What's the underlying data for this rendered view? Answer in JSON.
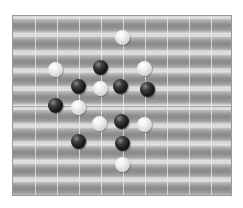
{
  "board": {
    "columns": 10,
    "rows": 10,
    "colors": {
      "background": "#ffffff",
      "tile_dark": "#8b8b8b",
      "tile_light": "#e6e6e6",
      "grid_line": "#ebebeb",
      "black_stone": "#141414",
      "white_stone": "#f0f0f0"
    }
  },
  "stones": [
    {
      "color": "white",
      "x": 122,
      "y": 37
    },
    {
      "color": "white",
      "x": 55,
      "y": 69
    },
    {
      "color": "black",
      "x": 100,
      "y": 67
    },
    {
      "color": "white",
      "x": 144,
      "y": 68
    },
    {
      "color": "black",
      "x": 78,
      "y": 86
    },
    {
      "color": "white",
      "x": 100,
      "y": 88
    },
    {
      "color": "black",
      "x": 120,
      "y": 86
    },
    {
      "color": "black",
      "x": 147,
      "y": 89
    },
    {
      "color": "black",
      "x": 55,
      "y": 105
    },
    {
      "color": "white",
      "x": 78,
      "y": 107
    },
    {
      "color": "white",
      "x": 99,
      "y": 123
    },
    {
      "color": "black",
      "x": 121,
      "y": 121
    },
    {
      "color": "white",
      "x": 144,
      "y": 124
    },
    {
      "color": "black",
      "x": 78,
      "y": 141
    },
    {
      "color": "black",
      "x": 122,
      "y": 143
    },
    {
      "color": "white",
      "x": 122,
      "y": 164
    }
  ]
}
